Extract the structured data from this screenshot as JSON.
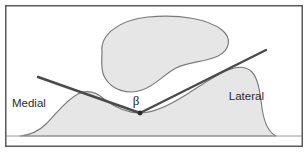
{
  "figure": {
    "type": "anatomical-angle-diagram",
    "width": 308,
    "height": 152,
    "background_color": "#ffffff",
    "border_color": "#5a5a5a",
    "border_width": 1.5
  },
  "labels": {
    "medial": "Medial",
    "lateral": "Lateral",
    "angle_symbol": "β"
  },
  "colors": {
    "shape_fill": "#e6e6e6",
    "shape_stroke": "#7a7a7a",
    "line_color": "#4a4a4a",
    "vertex_color": "#2a2a2a",
    "text_color": "#2b2b2b",
    "frame_color": "#5a5a5a",
    "baseline_color": "#9a9a9a"
  },
  "geometry": {
    "vertex": {
      "x": 140,
      "y": 113
    },
    "medial_line_start": {
      "x": 38,
      "y": 77
    },
    "lateral_line_end": {
      "x": 266,
      "y": 50
    },
    "baseline_y": 136,
    "frame": {
      "x": 5,
      "y": 5,
      "width": 298,
      "height": 142
    }
  },
  "shapes": {
    "superior_blob": {
      "name": "kidney-shaped-structure",
      "path": "M 102 52 C 100 34, 120 20, 148 17 C 180 14, 208 19, 222 30 C 232 38, 230 50, 218 56 C 205 62, 188 62, 176 68 C 163 75, 155 86, 142 90 C 128 95, 112 90, 105 78 C 100 70, 102 60, 102 52 Z"
    },
    "inferior_contour": {
      "name": "bony-contour",
      "path": "M 20 136 C 30 135, 38 132, 46 124 C 58 112, 66 100, 78 94 C 88 89, 96 92, 104 99 C 116 108, 128 113, 140 113 C 154 113, 168 106, 184 96 C 200 86, 214 76, 228 70 C 238 66, 246 66, 252 72 C 258 78, 260 92, 262 108 C 264 122, 268 132, 276 136 Z"
    }
  },
  "annotations": {
    "medial_position": {
      "x": 12,
      "y": 107
    },
    "lateral_position": {
      "x": 264,
      "y": 100
    },
    "angle_symbol_position": {
      "x": 136,
      "y": 105
    }
  }
}
